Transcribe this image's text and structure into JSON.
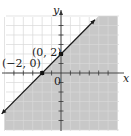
{
  "chart_data": {
    "type": "line",
    "title": "",
    "xlabel": "x",
    "ylabel": "y",
    "xlim": [
      -6,
      6
    ],
    "ylim": [
      -6,
      6
    ],
    "grid": true,
    "origin_label": "0",
    "line": {
      "slope": 1,
      "intercept": 2,
      "style": "solid",
      "arrows": "both"
    },
    "shaded_region": "below-right of line (y < x + 2)",
    "points": [
      {
        "x": -2,
        "y": 0,
        "label": "(−2, 0)"
      },
      {
        "x": 0,
        "y": 2,
        "label": "(0, 2)"
      }
    ],
    "colors": {
      "shade": "#c8c8c8",
      "grid": "#d9d9d9",
      "line": "#1a1a1a"
    }
  }
}
